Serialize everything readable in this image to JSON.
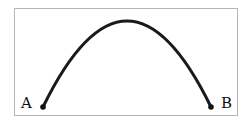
{
  "diagram": {
    "type": "parabolic-arc",
    "points": [
      {
        "label": "A",
        "x": 43,
        "y": 107
      },
      {
        "label": "B",
        "x": 211,
        "y": 107
      }
    ],
    "apex": {
      "x": 127,
      "y": 21
    },
    "colors": {
      "stroke": "#1a1a1a",
      "frame": "#b5b5b5",
      "background": "#ffffff"
    }
  }
}
